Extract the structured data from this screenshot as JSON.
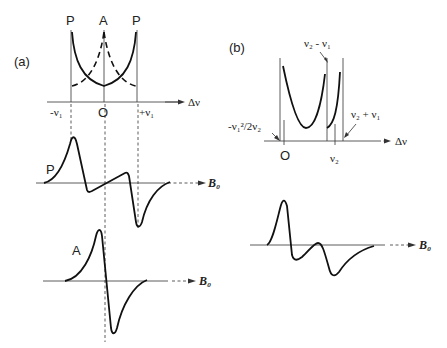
{
  "panel_a": {
    "label": "(a)",
    "peak_labels": [
      "P",
      "A",
      "P"
    ],
    "axis_label": "Δν",
    "ticks": [
      "-ν₁",
      "O",
      "+ν₁"
    ],
    "spectrum_p": {
      "label": "P",
      "field_label": "B₀"
    },
    "spectrum_a": {
      "label": "A",
      "field_label": "B₀"
    }
  },
  "panel_b": {
    "label": "(b)",
    "axis_label": "Δν",
    "annotations": {
      "top": "ν₂ - ν₁",
      "right": "ν₂ + ν₁",
      "left": "-ν₁²/2ν₂"
    },
    "ticks": [
      "O",
      "ν₂"
    ],
    "spectrum": {
      "field_label": "B₀"
    }
  }
}
